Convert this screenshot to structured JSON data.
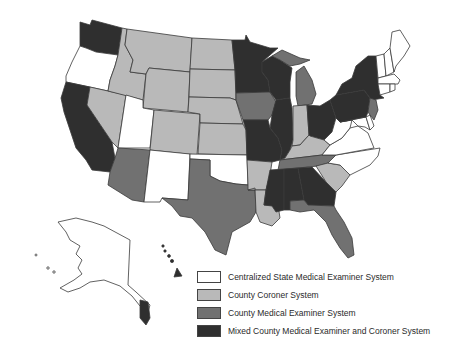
{
  "colors": {
    "centralized": "#ffffff",
    "coroner": "#b9b9b9",
    "county_me": "#717171",
    "mixed": "#2f2f2f",
    "border": "#3a3a3a"
  },
  "legend": {
    "items": [
      {
        "key": "centralized",
        "label": "Centralized State Medical Examiner System"
      },
      {
        "key": "coroner",
        "label": "County Coroner System"
      },
      {
        "key": "county_me",
        "label": "County Medical Examiner System"
      },
      {
        "key": "mixed",
        "label": "Mixed County Medical Examiner and Coroner System"
      }
    ]
  },
  "states": {
    "WA": "mixed",
    "OR": "centralized",
    "CA": "mixed",
    "NV": "coroner",
    "ID": "coroner",
    "MT": "coroner",
    "WY": "coroner",
    "UT": "centralized",
    "CO": "coroner",
    "AZ": "county_me",
    "NM": "centralized",
    "ND": "coroner",
    "SD": "coroner",
    "NE": "coroner",
    "KS": "coroner",
    "OK": "centralized",
    "TX": "county_me",
    "MN": "mixed",
    "IA": "county_me",
    "MO": "mixed",
    "AR": "coroner",
    "LA": "coroner",
    "WI": "mixed",
    "IL": "mixed",
    "MI": "county_me",
    "IN": "coroner",
    "OH": "mixed",
    "KY": "coroner",
    "TN": "county_me",
    "MS": "mixed",
    "AL": "mixed",
    "GA": "mixed",
    "FL": "county_me",
    "SC": "coroner",
    "NC": "centralized",
    "VA": "centralized",
    "WV": "centralized",
    "MD": "centralized",
    "DE": "centralized",
    "PA": "mixed",
    "NY": "mixed",
    "NJ": "county_me",
    "CT": "centralized",
    "RI": "centralized",
    "MA": "centralized",
    "VT": "centralized",
    "NH": "centralized",
    "ME": "centralized",
    "AK": "centralized",
    "HI": "mixed"
  }
}
